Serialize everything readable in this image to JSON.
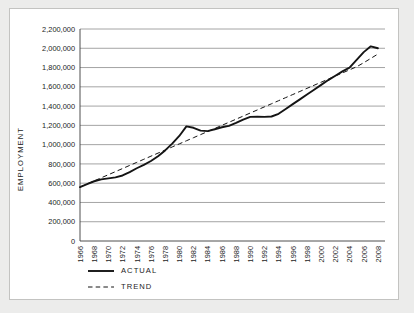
{
  "chart_data": {
    "type": "line",
    "title": "",
    "xlabel": "",
    "ylabel": "EMPLOYMENT",
    "ylim": [
      0,
      2200000
    ],
    "xlim": [
      1966,
      2009
    ],
    "grid": true,
    "legend_position": "bottom-left",
    "ytick_labels": [
      "2,200,000",
      "2,000,000",
      "1,800,000",
      "1,600,000",
      "1,400,000",
      "1,200,000",
      "1,000,000",
      "800,000",
      "600,000",
      "400,000",
      "200,000",
      "0"
    ],
    "ytick_values": [
      2200000,
      2000000,
      1800000,
      1600000,
      1400000,
      1200000,
      1000000,
      800000,
      600000,
      400000,
      200000,
      0
    ],
    "xtick_labels": [
      "1966",
      "1968",
      "1970",
      "1972",
      "1974",
      "1976",
      "1978",
      "1980",
      "1982",
      "1984",
      "1986",
      "1988",
      "1990",
      "1992",
      "1994",
      "1996",
      "1998",
      "2000",
      "2002",
      "2004",
      "2006",
      "2008"
    ],
    "xtick_values": [
      1966,
      1968,
      1970,
      1972,
      1974,
      1976,
      1978,
      1980,
      1982,
      1984,
      1986,
      1988,
      1990,
      1992,
      1994,
      1996,
      1998,
      2000,
      2002,
      2004,
      2006,
      2008
    ],
    "x": [
      1966,
      1967,
      1968,
      1969,
      1970,
      1971,
      1972,
      1973,
      1974,
      1975,
      1976,
      1977,
      1978,
      1979,
      1980,
      1981,
      1982,
      1983,
      1984,
      1985,
      1986,
      1987,
      1988,
      1989,
      1990,
      1991,
      1992,
      1993,
      1994,
      1995,
      1996,
      1997,
      1998,
      1999,
      2000,
      2001,
      2002,
      2003,
      2004,
      2005,
      2006,
      2007,
      2008
    ],
    "series": [
      {
        "name": "ACTUAL",
        "style": "solid",
        "color": "#141414",
        "values": [
          560000,
          590000,
          620000,
          640000,
          650000,
          660000,
          680000,
          715000,
          755000,
          790000,
          830000,
          880000,
          940000,
          1010000,
          1090000,
          1190000,
          1175000,
          1145000,
          1140000,
          1160000,
          1180000,
          1195000,
          1225000,
          1260000,
          1288000,
          1290000,
          1288000,
          1292000,
          1320000,
          1370000,
          1420000,
          1470000,
          1520000,
          1570000,
          1620000,
          1670000,
          1715000,
          1760000,
          1800000,
          1880000,
          1960000,
          2020000,
          2000000
        ]
      },
      {
        "name": "TREND",
        "style": "dashed",
        "color": "#141414",
        "values": [
          560000,
          592000,
          624000,
          656000,
          688000,
          720000,
          752000,
          784000,
          816000,
          848000,
          880000,
          912000,
          944000,
          976000,
          1008000,
          1040000,
          1072000,
          1104000,
          1136000,
          1168000,
          1200000,
          1232000,
          1264000,
          1296000,
          1328000,
          1360000,
          1392000,
          1424000,
          1456000,
          1488000,
          1520000,
          1552000,
          1584000,
          1616000,
          1648000,
          1680000,
          1712000,
          1744000,
          1776000,
          1808000,
          1850000,
          1895000,
          1940000
        ]
      }
    ],
    "legend": [
      {
        "label": "ACTUAL",
        "style": "solid"
      },
      {
        "label": "TREND",
        "style": "dashed"
      }
    ]
  }
}
